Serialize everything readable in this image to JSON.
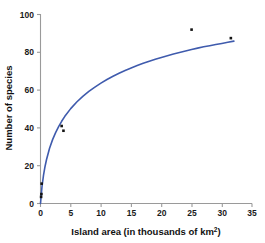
{
  "chart_data": {
    "type": "scatter",
    "title": "",
    "subtitle": "",
    "xlabel": "Island area (in thousands of km²)",
    "xlabel_base": "Island area (in thousands of km",
    "xlabel_sup": "2",
    "xlabel_close": ")",
    "ylabel": "Number of species",
    "xlim": [
      0,
      35
    ],
    "ylim": [
      0,
      100
    ],
    "xticks": [
      0,
      5,
      10,
      15,
      20,
      25,
      30,
      35
    ],
    "xtick_labels": [
      "0",
      "5",
      "10",
      "15",
      "20",
      "25",
      "30",
      "35"
    ],
    "yticks": [
      0,
      20,
      40,
      60,
      80,
      100
    ],
    "ytick_labels": [
      "0",
      "20",
      "40",
      "60",
      "80",
      "100"
    ],
    "grid": false,
    "legend": "none",
    "points": [
      {
        "x": 0.1,
        "y": 3.5
      },
      {
        "x": 0.15,
        "y": 5.0
      },
      {
        "x": 0.2,
        "y": 10.5
      },
      {
        "x": 3.5,
        "y": 41.0
      },
      {
        "x": 3.8,
        "y": 38.5
      },
      {
        "x": 25.0,
        "y": 92.0
      },
      {
        "x": 31.5,
        "y": 87.5
      }
    ],
    "series": [
      {
        "name": "fitted species-area curve",
        "type": "line",
        "color": "#3f5bad",
        "x": [
          0,
          0.25,
          0.5,
          0.75,
          1,
          1.5,
          2,
          2.5,
          3,
          3.5,
          4,
          5,
          6,
          7,
          8,
          9,
          10,
          11,
          12,
          13,
          14,
          15,
          16,
          17,
          18,
          19,
          20,
          21,
          22,
          23,
          24,
          25,
          26,
          27,
          28,
          29,
          30,
          31,
          32
        ],
        "y": [
          0,
          9.0,
          15.0,
          19.6,
          23.3,
          29.2,
          33.8,
          37.5,
          40.7,
          43.5,
          46.0,
          50.2,
          53.7,
          56.7,
          59.3,
          61.6,
          63.7,
          65.6,
          67.3,
          68.9,
          70.4,
          71.7,
          73.0,
          74.2,
          75.3,
          76.3,
          77.3,
          78.2,
          79.1,
          79.9,
          80.7,
          81.5,
          82.2,
          82.9,
          83.5,
          84.1,
          84.7,
          85.3,
          85.9
        ]
      }
    ],
    "marker_color": "#141414",
    "axis_color": "#9a9a9a",
    "accent_color": "#3f5bad",
    "background": "#ffffff"
  }
}
